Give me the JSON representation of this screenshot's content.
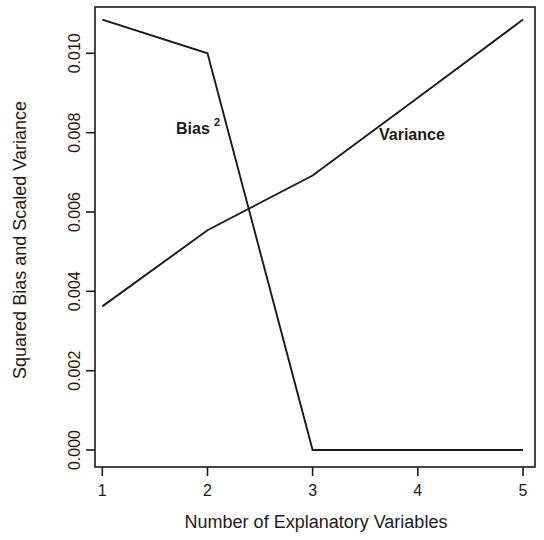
{
  "chart_data": {
    "type": "line",
    "title": "",
    "xlabel": "Number of Explanatory Variables",
    "ylabel": "Squared Bias and Scaled Variance",
    "x": [
      1,
      2,
      3,
      4,
      5
    ],
    "xlim": [
      0.8,
      5.2
    ],
    "ylim": [
      0.0,
      0.01134
    ],
    "xticks": [
      1,
      2,
      3,
      4,
      5
    ],
    "xtick_labels": [
      "1",
      "2",
      "3",
      "4",
      "5"
    ],
    "yticks": [
      0.0,
      0.002,
      0.004,
      0.006,
      0.008,
      0.01
    ],
    "ytick_labels": [
      "0.000",
      "0.002",
      "0.004",
      "0.006",
      "0.008",
      "0.010"
    ],
    "grid": false,
    "legend_position": "inline-annotations",
    "series": [
      {
        "name": "Bias^2",
        "label_text": "Bias",
        "label_superscript": "2",
        "color": "#1a1a1a",
        "values": [
          0.01085,
          0.01,
          0.0,
          0.0,
          0.0
        ]
      },
      {
        "name": "Variance",
        "label_text": "Variance",
        "label_superscript": "",
        "color": "#1a1a1a",
        "values": [
          0.00362,
          0.00554,
          0.00692,
          0.00888,
          0.01085
        ]
      }
    ],
    "annotations": [
      {
        "text": "Bias",
        "superscript": "2",
        "x_px": 176,
        "y_px": 134
      },
      {
        "text": "Variance",
        "superscript": "",
        "x_px": 379,
        "y_px": 140
      }
    ],
    "axis_color": "#1a1a1a",
    "background": "#ffffff"
  },
  "geometry": {
    "plot_left": 95,
    "plot_right": 535,
    "plot_top": 7,
    "plot_bottom": 467,
    "x_pixels": {
      "1": 102.3,
      "2": 207.5,
      "3": 312.6,
      "4": 417.8,
      "5": 523.0
    },
    "y_zero_px": 450,
    "y_per_unit_px": 39670
  }
}
